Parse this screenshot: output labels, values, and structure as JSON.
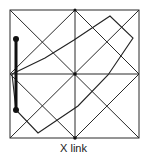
{
  "figure": {
    "caption": "X link",
    "colors": {
      "line": "#2a2a2a",
      "bold": "#111111",
      "background": "#ffffff"
    },
    "frame": {
      "x1": 10,
      "y1": 10,
      "x2": 139,
      "y2": 138
    },
    "polygon_points": "12,74 45,58 74,40 110,16 133,38 108,75 78,106 38,133 16,110",
    "bar": {
      "x": 16,
      "y1": 39,
      "y2": 110
    }
  }
}
